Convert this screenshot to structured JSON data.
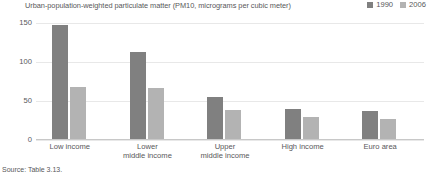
{
  "chart_data": {
    "type": "bar",
    "title": "Urban-population-weighted particulate matter (PM10, micrograms per cubic meter)",
    "xlabel": "",
    "ylabel": "",
    "ylim": [
      0,
      150
    ],
    "yticks": [
      0,
      50,
      100,
      150
    ],
    "ytick_labels": [
      "0",
      "50",
      "100",
      "150"
    ],
    "grid": true,
    "legend_position": "top-right",
    "categories": [
      "Low income",
      "Lower\nmiddle income",
      "Upper\nmiddle income",
      "High income",
      "Euro area"
    ],
    "category_lines": [
      [
        "Low income"
      ],
      [
        "Lower",
        "middle income"
      ],
      [
        "Upper",
        "middle income"
      ],
      [
        "High income"
      ],
      [
        "Euro area"
      ]
    ],
    "series": [
      {
        "name": "1990",
        "color": "#808080",
        "values": [
          148,
          113,
          55,
          40,
          37
        ]
      },
      {
        "name": "2006",
        "color": "#b3b3b3",
        "values": [
          68,
          67,
          38,
          30,
          27
        ]
      }
    ]
  },
  "source_note": "Source: Table 3.13."
}
